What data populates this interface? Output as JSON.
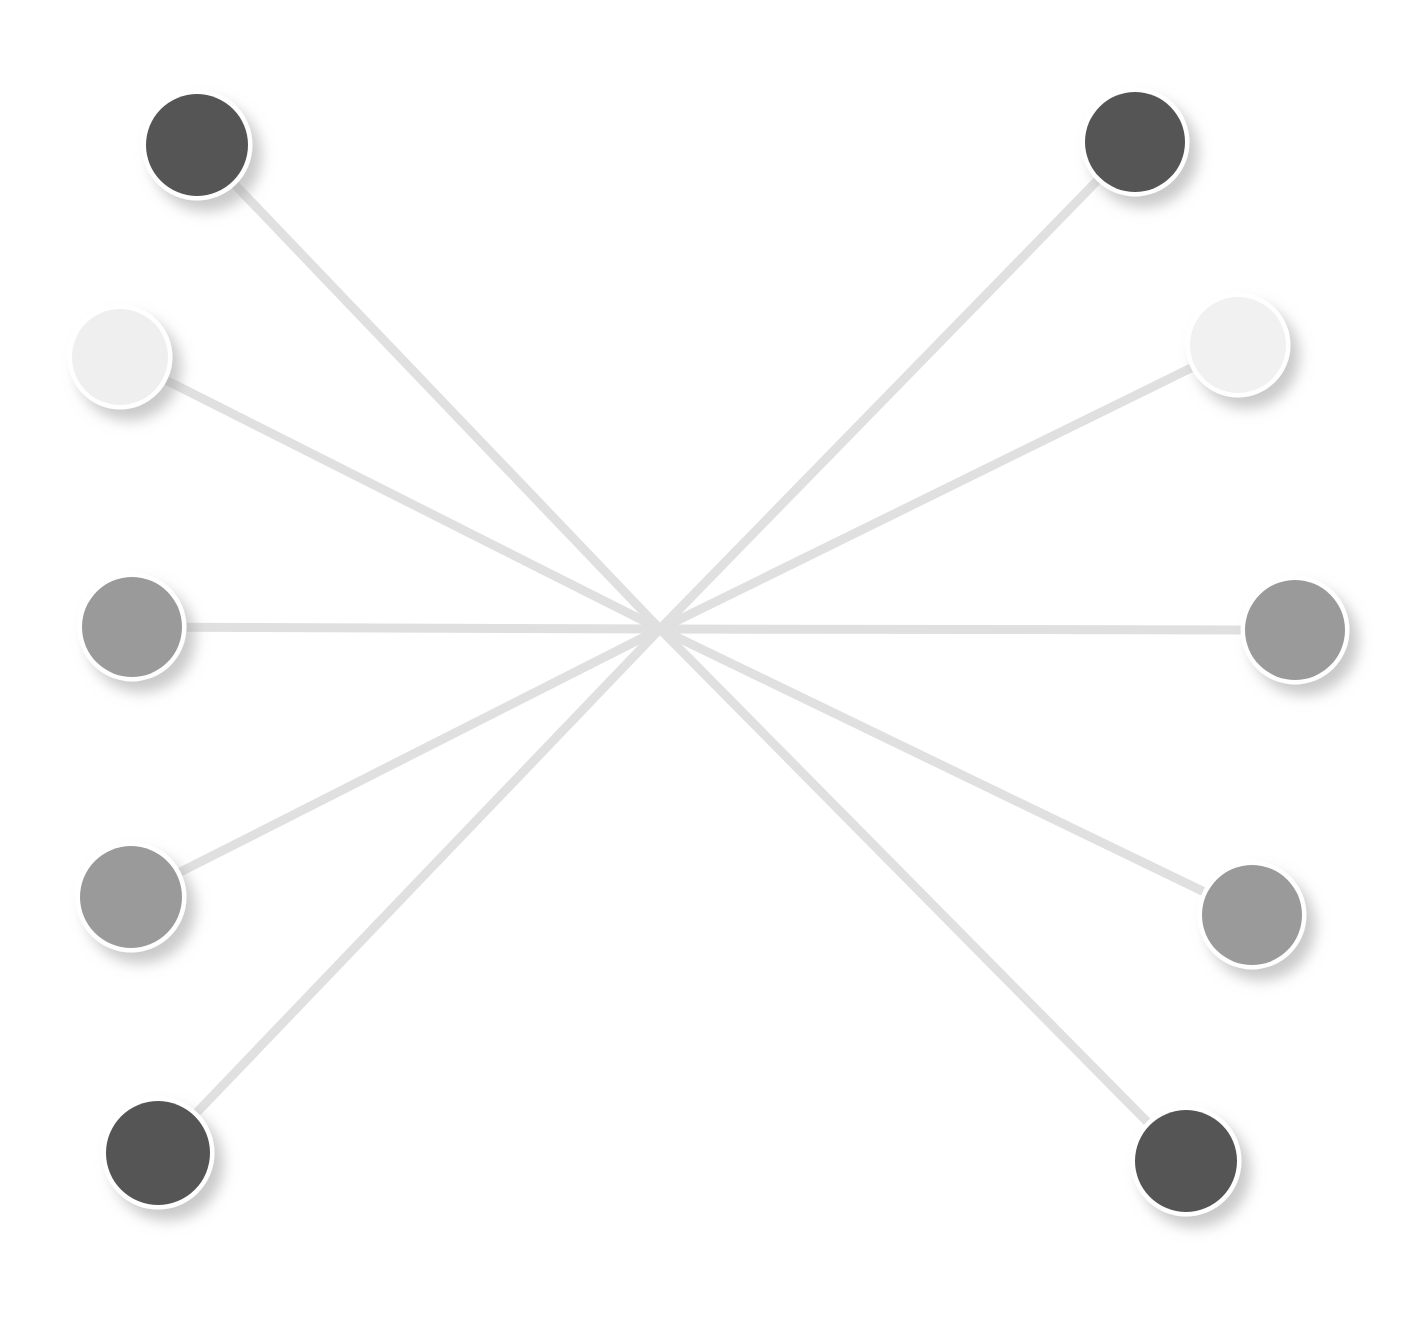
{
  "canvas": {
    "width": 1421,
    "height": 1319,
    "background": "#ffffff",
    "title": "Radial Node Link Graph"
  },
  "style": {
    "edge_color": "#e0e0e0",
    "edge_width": 9,
    "node_ring_color": "#ffffff",
    "node_ring_width": 9,
    "node_shadow_color": "#b4b4b4",
    "node_shadow_dx": 9,
    "node_shadow_dy": 11,
    "node_shadow_blur": 7,
    "node_radius": 50
  },
  "chart_data": {
    "type": "scatter",
    "xlabel": "",
    "ylabel": "",
    "xlim": [
      0,
      1421
    ],
    "ylim": [
      0,
      1319
    ],
    "grid": false,
    "legend": "none",
    "layout": "radial-star",
    "hub": {
      "name": "hub",
      "x": 660,
      "y": 629,
      "visible": false
    },
    "nodes": [
      {
        "id": "n1",
        "label": "node-1",
        "x": 197,
        "y": 145,
        "r": 51,
        "color": "#555555",
        "shade": "dark"
      },
      {
        "id": "n2",
        "label": "node-2",
        "x": 120,
        "y": 357,
        "r": 48,
        "color": "#efefef",
        "shade": "very-light"
      },
      {
        "id": "n3",
        "label": "node-3",
        "x": 132,
        "y": 627,
        "r": 50,
        "color": "#9a9a9a",
        "shade": "mid"
      },
      {
        "id": "n4",
        "label": "node-4",
        "x": 131,
        "y": 897,
        "r": 51,
        "color": "#9a9a9a",
        "shade": "mid"
      },
      {
        "id": "n5",
        "label": "node-5",
        "x": 158,
        "y": 1153,
        "r": 52,
        "color": "#555555",
        "shade": "dark"
      },
      {
        "id": "n6",
        "label": "node-6",
        "x": 1135,
        "y": 142,
        "r": 50,
        "color": "#555555",
        "shade": "dark"
      },
      {
        "id": "n7",
        "label": "node-7",
        "x": 1238,
        "y": 345,
        "r": 48,
        "color": "#f1f1f1",
        "shade": "very-light"
      },
      {
        "id": "n8",
        "label": "node-8",
        "x": 1295,
        "y": 630,
        "r": 50,
        "color": "#9a9a9a",
        "shade": "mid"
      },
      {
        "id": "n9",
        "label": "node-9",
        "x": 1252,
        "y": 915,
        "r": 50,
        "color": "#9a9a9a",
        "shade": "mid"
      },
      {
        "id": "n10",
        "label": "node-10",
        "x": 1186,
        "y": 1161,
        "r": 51,
        "color": "#555555",
        "shade": "dark"
      }
    ],
    "edges": [
      {
        "id": "e1",
        "from": "n1",
        "to": "hub"
      },
      {
        "id": "e2",
        "from": "n2",
        "to": "hub"
      },
      {
        "id": "e3",
        "from": "n3",
        "to": "hub"
      },
      {
        "id": "e4",
        "from": "n4",
        "to": "hub"
      },
      {
        "id": "e5",
        "from": "n5",
        "to": "hub"
      },
      {
        "id": "e6",
        "from": "n6",
        "to": "hub"
      },
      {
        "id": "e7",
        "from": "n7",
        "to": "hub"
      },
      {
        "id": "e8",
        "from": "n8",
        "to": "hub"
      },
      {
        "id": "e9",
        "from": "n9",
        "to": "hub"
      },
      {
        "id": "e10",
        "from": "n10",
        "to": "hub"
      }
    ]
  }
}
